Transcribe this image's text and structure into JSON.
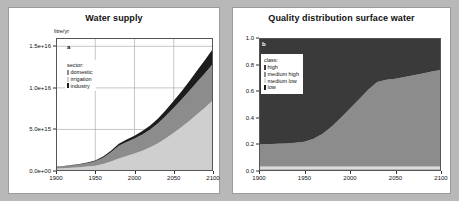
{
  "figure": {
    "background_color": "#b8b8b8",
    "panel_background": "#ffffff"
  },
  "panels": [
    {
      "letter": "a",
      "title": "Water supply",
      "unit_label": "litre/yr"
    },
    {
      "letter": "b",
      "title": "Quality distribution surface water",
      "unit_label": ""
    }
  ],
  "chart_data": [
    {
      "type": "area",
      "id": "water-supply",
      "panel_letter": "a",
      "title": "Water supply",
      "xlabel": "",
      "ylabel": "litre/yr",
      "xlim": [
        1900,
        2100
      ],
      "ylim": [
        0,
        1.6e+16
      ],
      "xticks": [
        1900,
        1950,
        2000,
        2050,
        2100
      ],
      "xtick_labels": [
        "1900",
        "1950",
        "2000",
        "2050",
        "2100"
      ],
      "yticks": [
        0,
        5000000000000000.0,
        1e+16,
        1.5e+16
      ],
      "ytick_labels": [
        "0.0e+00",
        "5.0e+15",
        "1.0e+16",
        "1.5e+16"
      ],
      "grid": true,
      "stacked": true,
      "legend_title": "sector:",
      "legend_position": "upper-left-inside",
      "x": [
        1900,
        1910,
        1920,
        1930,
        1940,
        1950,
        1960,
        1970,
        1980,
        1990,
        2000,
        2010,
        2020,
        2030,
        2040,
        2050,
        2060,
        2070,
        2080,
        2090,
        2100
      ],
      "series": [
        {
          "name": "irrigation",
          "color": "#cfcfcf",
          "values": [
            300000000000000.0,
            340000000000000.0,
            390000000000000.0,
            450000000000000.0,
            530000000000000.0,
            640000000000000.0,
            850000000000000.0,
            1150000000000000.0,
            1500000000000000.0,
            1800000000000000.0,
            2100000000000000.0,
            2450000000000000.0,
            2850000000000000.0,
            3350000000000000.0,
            3950000000000000.0,
            4600000000000000.0,
            5300000000000000.0,
            6050000000000000.0,
            6850000000000000.0,
            7650000000000000.0,
            8500000000000000.0
          ]
        },
        {
          "name": "domestic",
          "color": "#8c8c8c",
          "values": [
            200000000000000.0,
            230000000000000.0,
            270000000000000.0,
            320000000000000.0,
            400000000000000.0,
            520000000000000.0,
            750000000000000.0,
            1100000000000000.0,
            1550000000000000.0,
            1700000000000000.0,
            1800000000000000.0,
            1950000000000000.0,
            2150000000000000.0,
            2400000000000000.0,
            2700000000000000.0,
            3000000000000000.0,
            3300000000000000.0,
            3600000000000000.0,
            3900000000000000.0,
            4150000000000000.0,
            4400000000000000.0
          ]
        },
        {
          "name": "industry",
          "color": "#1c1c1c",
          "values": [
            40000000000000.0,
            45000000000000.0,
            55000000000000.0,
            65000000000000.0,
            80000000000000.0,
            100000000000000.0,
            140000000000000.0,
            190000000000000.0,
            240000000000000.0,
            290000000000000.0,
            340000000000000.0,
            400000000000000.0,
            480000000000000.0,
            580000000000000.0,
            700000000000000.0,
            840000000000000.0,
            1000000000000000.0,
            1180000000000000.0,
            1380000000000000.0,
            1580000000000000.0,
            1800000000000000.0
          ]
        }
      ],
      "legend_items": [
        {
          "label": "domestic",
          "color": "#8c8c8c"
        },
        {
          "label": "irrigation",
          "color": "#cfcfcf"
        },
        {
          "label": "industry",
          "color": "#1c1c1c"
        }
      ]
    },
    {
      "type": "area",
      "id": "quality-distribution-surface-water",
      "panel_letter": "b",
      "title": "Quality distribution surface water",
      "xlabel": "",
      "ylabel": "",
      "xlim": [
        1900,
        2100
      ],
      "ylim": [
        0,
        1.0
      ],
      "xticks": [
        1900,
        1950,
        2000,
        2050,
        2100
      ],
      "xtick_labels": [
        "1900",
        "1950",
        "2000",
        "2050",
        "2100"
      ],
      "yticks": [
        0.0,
        0.2,
        0.4,
        0.6,
        0.8,
        1.0
      ],
      "ytick_labels": [
        "0.0",
        "0.2",
        "0.4",
        "0.6",
        "0.8",
        "1.0"
      ],
      "grid": false,
      "stacked": true,
      "normalized": true,
      "legend_title": "class:",
      "legend_position": "upper-left-inside",
      "x": [
        1900,
        1910,
        1920,
        1930,
        1940,
        1950,
        1960,
        1970,
        1980,
        1990,
        2000,
        2010,
        2020,
        2030,
        2040,
        2050,
        2060,
        2070,
        2080,
        2090,
        2100
      ],
      "series": [
        {
          "name": "low",
          "color": "#1c1c1c",
          "values": [
            0.012,
            0.012,
            0.012,
            0.012,
            0.012,
            0.012,
            0.012,
            0.012,
            0.012,
            0.012,
            0.012,
            0.012,
            0.012,
            0.012,
            0.012,
            0.012,
            0.012,
            0.012,
            0.012,
            0.012,
            0.012
          ]
        },
        {
          "name": "medium low",
          "color": "#dcdcdc",
          "values": [
            0.022,
            0.022,
            0.022,
            0.022,
            0.022,
            0.022,
            0.022,
            0.022,
            0.022,
            0.022,
            0.022,
            0.022,
            0.022,
            0.022,
            0.022,
            0.022,
            0.022,
            0.022,
            0.022,
            0.022,
            0.022
          ]
        },
        {
          "name": "medium high",
          "color": "#8c8c8c",
          "values": [
            0.166,
            0.168,
            0.17,
            0.173,
            0.178,
            0.186,
            0.208,
            0.246,
            0.3,
            0.366,
            0.436,
            0.506,
            0.576,
            0.636,
            0.652,
            0.66,
            0.672,
            0.686,
            0.7,
            0.714,
            0.726
          ]
        },
        {
          "name": "high",
          "color": "#3a3a3a",
          "values": [
            0.8,
            0.798,
            0.796,
            0.793,
            0.788,
            0.78,
            0.758,
            0.72,
            0.666,
            0.6,
            0.53,
            0.46,
            0.39,
            0.33,
            0.314,
            0.306,
            0.294,
            0.28,
            0.266,
            0.252,
            0.24
          ]
        }
      ],
      "legend_items": [
        {
          "label": "high",
          "color": "#3a3a3a"
        },
        {
          "label": "medium high",
          "color": "#8c8c8c"
        },
        {
          "label": "medium low",
          "color": "#dcdcdc"
        },
        {
          "label": "low",
          "color": "#1c1c1c"
        }
      ]
    }
  ]
}
